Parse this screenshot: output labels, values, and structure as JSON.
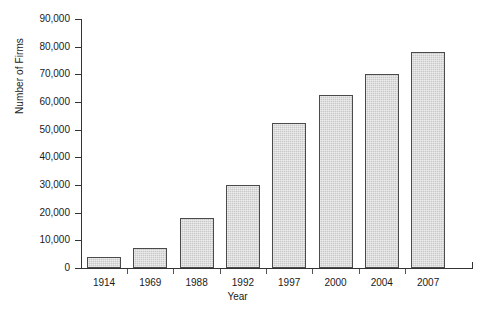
{
  "chart": {
    "type": "bar",
    "title": "",
    "xlabel": "Year",
    "ylabel": "Number of Firms",
    "background_color": "#ffffff",
    "bar_fill_color": "#c9c9c9",
    "bar_border_color": "#4a4a4a",
    "axis_color": "#333333",
    "grid": "none",
    "legend": "none"
  },
  "chart_data": {
    "type": "bar",
    "title": "",
    "xlabel": "Year",
    "ylabel": "Number of Firms",
    "categories": [
      "1914",
      "1969",
      "1988",
      "1992",
      "1997",
      "2000",
      "2004",
      "2007"
    ],
    "values": [
      4000,
      7200,
      18000,
      30000,
      52500,
      62500,
      70000,
      78000
    ],
    "ylim": [
      0,
      90000
    ],
    "ytick_values": [
      0,
      10000,
      20000,
      30000,
      40000,
      50000,
      60000,
      70000,
      80000,
      90000
    ],
    "ytick_labels": [
      "0",
      "10,000",
      "20,000",
      "30,000",
      "40,000",
      "50,000",
      "60,000",
      "70,000",
      "80,000",
      "90,000"
    ],
    "grid": false,
    "legend_position": "none"
  }
}
